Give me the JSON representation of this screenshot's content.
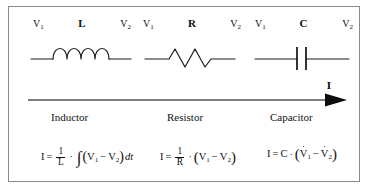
{
  "figure": {
    "border_color": "#8a8a8a",
    "background": "#ffffff",
    "ink_color": "#111111"
  },
  "components": [
    {
      "name": "inductor",
      "letter": "L",
      "symbol": "inductor-coil-symbol",
      "left_terminal": "V",
      "left_terminal_sub": "1",
      "right_terminal": "V",
      "right_terminal_sub": "2",
      "label": "Inductor"
    },
    {
      "name": "resistor",
      "letter": "R",
      "symbol": "resistor-zigzag-symbol",
      "left_terminal": "V",
      "left_terminal_sub": "1",
      "right_terminal": "V",
      "right_terminal_sub": "2",
      "label": "Resistor"
    },
    {
      "name": "capacitor",
      "letter": "C",
      "symbol": "capacitor-plates-symbol",
      "left_terminal": "V",
      "left_terminal_sub": "1",
      "right_terminal": "V",
      "right_terminal_sub": "2",
      "label": "Capacitor"
    }
  ],
  "current_arrow": {
    "label": "I",
    "direction": "right",
    "name": "current-direction-arrow"
  },
  "equations": {
    "inductor": {
      "lhs": "I",
      "equals": "=",
      "numerator": "1",
      "denominator": "L",
      "operator": "·",
      "integral": "∫",
      "open_paren": "(",
      "v1": "V",
      "v1_sub": "1",
      "minus": "−",
      "v2": "V",
      "v2_sub": "2",
      "close_paren": ")",
      "differential": "dt",
      "plain": "I = (1/L) · ∫(V₁ − V₂)dt"
    },
    "resistor": {
      "lhs": "I",
      "equals": "=",
      "numerator": "1",
      "denominator": "R",
      "operator": "·",
      "open_paren": "(",
      "v1": "V",
      "v1_sub": "1",
      "minus": "−",
      "v2": "V",
      "v2_sub": "2",
      "close_paren": ")",
      "plain": "I = (1/R) · (V₁ − V₂)"
    },
    "capacitor": {
      "lhs": "I",
      "equals": "=",
      "coefficient": "C",
      "operator": "·",
      "open_paren": "(",
      "v1": "V",
      "v1_sub": "1",
      "minus": "−",
      "v2": "V",
      "v2_sub": "2",
      "close_paren": ")",
      "plain": "I = C · (V̇₁ − V̇₂)"
    }
  }
}
